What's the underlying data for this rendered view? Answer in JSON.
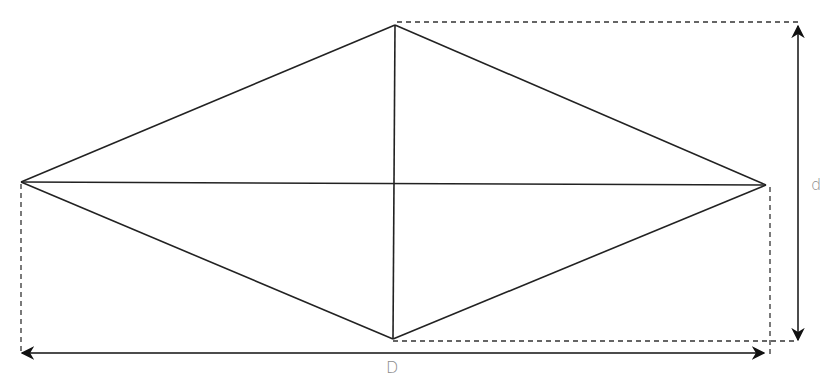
{
  "diagram": {
    "type": "rhombus-diagonals",
    "colors": {
      "stroke": "#222222",
      "dashed": "#333333",
      "label": "#8a8a8a",
      "background": "#ffffff"
    },
    "vertices": {
      "top": [
        395,
        25
      ],
      "right": [
        766,
        185
      ],
      "bottom": [
        393,
        339
      ],
      "left": [
        21,
        182
      ]
    },
    "labels": {
      "short_diagonal": "d",
      "long_diagonal": "D"
    }
  }
}
